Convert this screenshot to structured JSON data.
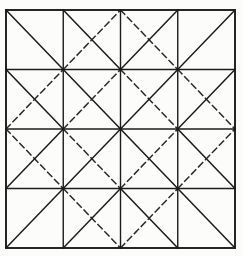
{
  "figure": {
    "type": "geometric-line-diagram",
    "background_color": "#fcfcfa",
    "line_color": "#1c1c1c",
    "dash_color": "#2a2a2a"
  },
  "canvas": {
    "width": 243,
    "height": 256
  },
  "grid": {
    "x0": 6,
    "y0": 10,
    "x1": 235,
    "y1": 248,
    "rows": 4,
    "cols": 4,
    "border_width": 1.9,
    "inner_width": 1.4,
    "diagonal_width": 1.5,
    "dash_pattern": "6,4",
    "border_label": "outer-square-border",
    "vertical_lines_label": "grid-vertical-lines",
    "horizontal_lines_label": "grid-horizontal-lines"
  },
  "cells": [
    {
      "row": 0,
      "col": 0,
      "name": "cell-r1c1",
      "backslash": "solid",
      "slash": "none"
    },
    {
      "row": 0,
      "col": 1,
      "name": "cell-r1c2",
      "backslash": "solid",
      "slash": "dashed"
    },
    {
      "row": 0,
      "col": 2,
      "name": "cell-r1c3",
      "backslash": "dashed",
      "slash": "solid"
    },
    {
      "row": 0,
      "col": 3,
      "name": "cell-r1c4",
      "backslash": "none",
      "slash": "solid"
    },
    {
      "row": 1,
      "col": 0,
      "name": "cell-r2c1",
      "backslash": "solid",
      "slash": "dashed"
    },
    {
      "row": 1,
      "col": 1,
      "name": "cell-r2c2",
      "backslash": "solid",
      "slash": "dashed"
    },
    {
      "row": 1,
      "col": 2,
      "name": "cell-r2c3",
      "backslash": "dashed",
      "slash": "solid"
    },
    {
      "row": 1,
      "col": 3,
      "name": "cell-r2c4",
      "backslash": "dashed",
      "slash": "solid"
    },
    {
      "row": 2,
      "col": 0,
      "name": "cell-r3c1",
      "backslash": "dashed",
      "slash": "solid"
    },
    {
      "row": 2,
      "col": 1,
      "name": "cell-r3c2",
      "backslash": "dashed",
      "slash": "solid"
    },
    {
      "row": 2,
      "col": 2,
      "name": "cell-r3c3",
      "backslash": "solid",
      "slash": "dashed"
    },
    {
      "row": 2,
      "col": 3,
      "name": "cell-r3c4",
      "backslash": "solid",
      "slash": "dashed"
    },
    {
      "row": 3,
      "col": 0,
      "name": "cell-r4c1",
      "backslash": "none",
      "slash": "solid"
    },
    {
      "row": 3,
      "col": 1,
      "name": "cell-r4c2",
      "backslash": "dashed",
      "slash": "solid"
    },
    {
      "row": 3,
      "col": 2,
      "name": "cell-r4c3",
      "backslash": "solid",
      "slash": "dashed"
    },
    {
      "row": 3,
      "col": 3,
      "name": "cell-r4c4",
      "backslash": "solid",
      "slash": "none"
    }
  ]
}
